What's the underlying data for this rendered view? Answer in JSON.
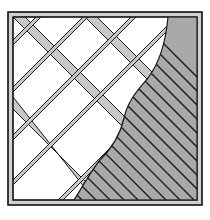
{
  "figure": {
    "type": "technical illustration",
    "colors": {
      "background": "#ffffff",
      "outline": "#1a1a1a",
      "lattice_fill": "#c8c8c8",
      "hatch_fill": "#a9a9a9",
      "hatch_lines": "#1a1a1a"
    },
    "frame": {
      "x": 8,
      "y": 12,
      "width": 194,
      "height": 193,
      "border_width": 5
    },
    "lattice": {
      "bar_width": 8,
      "directions": [
        "down-right (45°)",
        "up-right (45°)"
      ]
    },
    "hatched_region": {
      "hatch_direction": "down-right (45°)",
      "hatch_spacing": 14
    }
  }
}
